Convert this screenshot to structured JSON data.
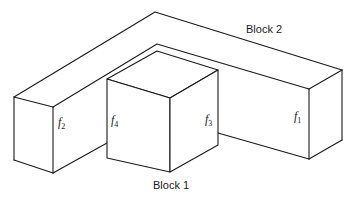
{
  "diagram": {
    "type": "isometric-block-drawing",
    "blocks": [
      {
        "id": "block1",
        "label": "Block 1"
      },
      {
        "id": "block2",
        "label": "Block 2"
      }
    ],
    "faces": [
      {
        "id": "f1",
        "base": "f",
        "sub": "1"
      },
      {
        "id": "f2",
        "base": "f",
        "sub": "2"
      },
      {
        "id": "f3",
        "base": "f",
        "sub": "3"
      },
      {
        "id": "f4",
        "base": "f",
        "sub": "4"
      }
    ],
    "stroke_color": "#1a1a1a",
    "background": "#ffffff"
  }
}
